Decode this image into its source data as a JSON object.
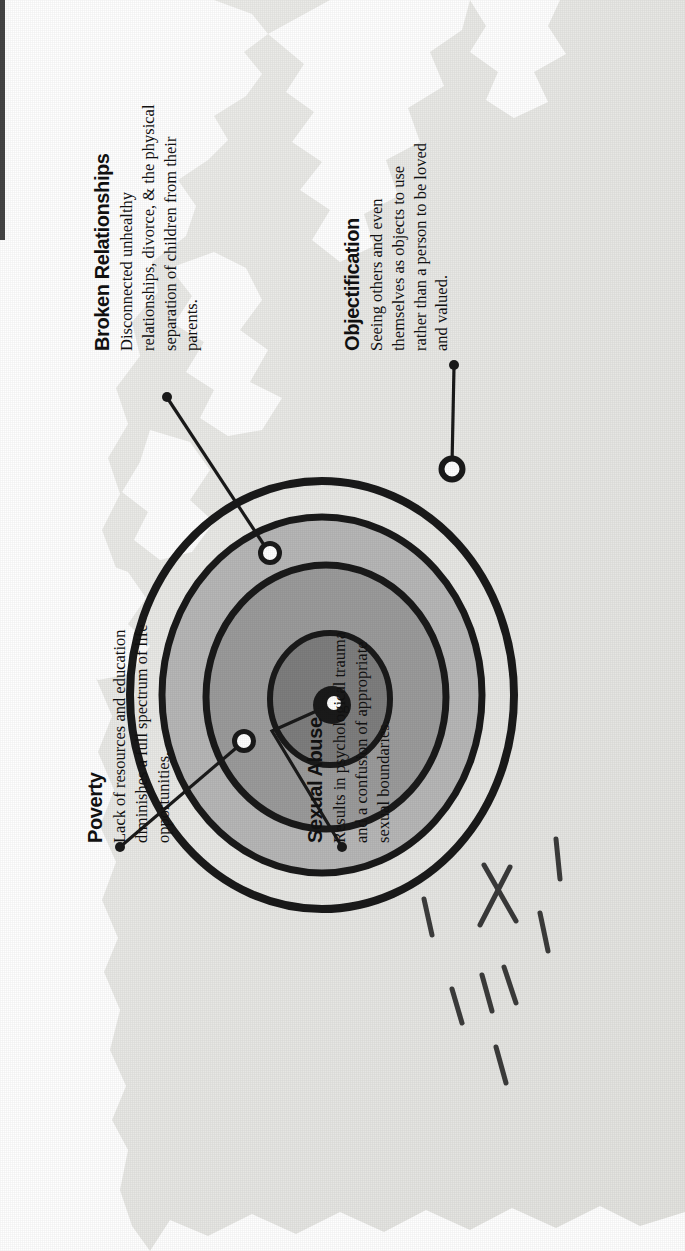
{
  "diagram": {
    "type": "concentric-target",
    "orientation": "rotated-90-ccw",
    "background": {
      "paper_color": "#e9e9e6",
      "page_color": "#ffffff",
      "edge_style": "torn-ragged"
    },
    "rings": [
      {
        "name": "outer-ring-outline",
        "fill": "#e9e9e6",
        "stroke": "#1a1a1a",
        "radius": 196
      },
      {
        "name": "ring-light-gray",
        "fill": "#b9b9b9",
        "stroke": "#1a1a1a",
        "radius": 166
      },
      {
        "name": "ring-medium-gray",
        "fill": "#9a9a9a",
        "stroke": "#1a1a1a",
        "radius": 124
      },
      {
        "name": "ring-dark-gray",
        "fill": "#7d7d7d",
        "stroke": "#1a1a1a",
        "radius": 62
      },
      {
        "name": "bullseye-center",
        "fill": "#171717",
        "stroke": "#171717",
        "radius": 19
      }
    ],
    "markers": [
      {
        "name": "marker-poverty",
        "style": "white-dot-black-ring"
      },
      {
        "name": "marker-sexual-abuse",
        "style": "white-dot-black-ring"
      },
      {
        "name": "marker-broken",
        "style": "white-dot-black-ring"
      },
      {
        "name": "marker-objectify",
        "style": "white-dot-black-ring"
      }
    ],
    "accent_color": "#1a1a1a"
  },
  "callouts": [
    {
      "id": "poverty",
      "title": "Poverty",
      "body": "Lack of resources and education diminishes a full spectrum of life opportunities."
    },
    {
      "id": "sexual-abuse",
      "title": "Sexual Abuse",
      "body": "Results in psychological trauma and a confusion of appropriate sexual boundaries."
    },
    {
      "id": "broken-relationships",
      "title": "Broken Relationships",
      "body": "Disconnected unhealthy relationships, divorce, & the physical separation of children from their parents."
    },
    {
      "id": "objectification",
      "title": "Objectification",
      "body": "Seeing others and even themselves as objects to use rather than a person to be loved and valued."
    }
  ],
  "decorations": {
    "radiating_dashes": "dash-marks",
    "cross_mark": "x-mark-on-outer-ring"
  }
}
